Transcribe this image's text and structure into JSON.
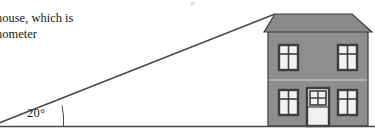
{
  "figure": {
    "kind": "trigonometry-diagram"
  },
  "caption": {
    "line1": "house, which is",
    "line2": "nometer",
    "cropped_descender": "g"
  },
  "angle": {
    "value": "20°",
    "degrees": 20
  },
  "colors": {
    "wall": "#8e8e8e",
    "roof": "#8a8a8a",
    "outline": "#3d3d3d",
    "window_glass": "#f2f2f2",
    "door_panel": "#f0f0f0",
    "line": "#4a4a4a",
    "text": "#1a1a1a",
    "background": "#ffffff"
  },
  "house": {
    "label": "house",
    "roof_label": "roof",
    "door_label": "front-door",
    "floor_divider_label": "floor-divider",
    "windows": [
      {
        "id": "upper-left",
        "panes": 4
      },
      {
        "id": "upper-right",
        "panes": 4
      },
      {
        "id": "lower-left",
        "panes": 4
      },
      {
        "id": "lower-right",
        "panes": 4
      }
    ],
    "door": {
      "fanlight_panes": 4
    }
  },
  "lines": {
    "ground_label": "ground-line",
    "sight_label": "line-of-sight",
    "arc_label": "angle-arc"
  }
}
